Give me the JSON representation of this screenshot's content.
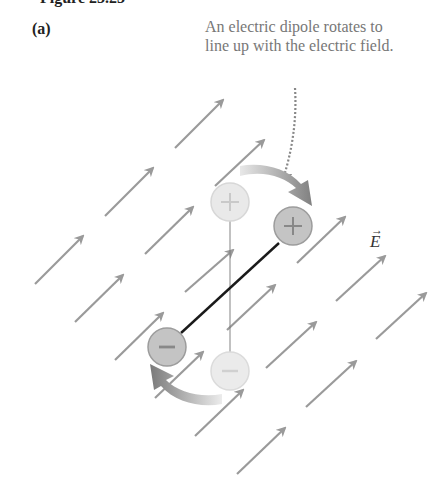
{
  "header": {
    "cropped_title_fragment": "Figure 23.23",
    "panel_label": "(a)"
  },
  "annotation": {
    "text": "An electric dipole rotates to line up with the electric field."
  },
  "field": {
    "label": "E",
    "vector_mark": "→",
    "arrow_color": "#9a9a9a",
    "arrows": [
      [
        175,
        148,
        223,
        100
      ],
      [
        215,
        186,
        264,
        140
      ],
      [
        105,
        216,
        153,
        168
      ],
      [
        145,
        254,
        193,
        207
      ],
      [
        185,
        292,
        233,
        250
      ],
      [
        227,
        330,
        275,
        285
      ],
      [
        266,
        368,
        316,
        322
      ],
      [
        306,
        407,
        356,
        361
      ],
      [
        35,
        284,
        83,
        236
      ],
      [
        75,
        322,
        123,
        275
      ],
      [
        115,
        360,
        163,
        313
      ],
      [
        155,
        398,
        203,
        352
      ],
      [
        195,
        436,
        243,
        390
      ],
      [
        237,
        474,
        285,
        428
      ],
      [
        297,
        263,
        345,
        217
      ],
      [
        336,
        301,
        385,
        256
      ],
      [
        376,
        339,
        426,
        293
      ]
    ]
  },
  "dipole": {
    "initial": {
      "plus": [
        230,
        202
      ],
      "minus": [
        230,
        371
      ],
      "opacity": 0.45
    },
    "final": {
      "plus": [
        293,
        226
      ],
      "minus": [
        167,
        347
      ]
    },
    "radius": 19,
    "plus_symbol": "+",
    "minus_symbol": "−",
    "rod_color": "#1a1a1a",
    "charge_fill": "#c4c4c4",
    "charge_stroke": "#9c9c9c"
  }
}
